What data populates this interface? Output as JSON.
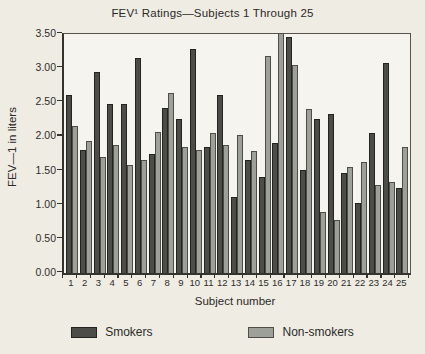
{
  "title": "FEV¹ Ratings—Subjects 1 Through 25",
  "axes": {
    "x_title": "Subject number",
    "y_title": "FEV—1 in liters"
  },
  "legend": {
    "smokers_label": "Smokers",
    "nonsmokers_label": "Non-smokers"
  },
  "colors": {
    "smokers_bar": "#4c4d49",
    "nonsmokers_bar": "#9da098",
    "paper_background": "#efece4",
    "plot_background": "#f6f4ee",
    "axis_line": "#35332e"
  },
  "chart_data": {
    "type": "bar",
    "title": "FEV¹ Ratings—Subjects 1 Through 25",
    "xlabel": "Subject number",
    "ylabel": "FEV—1 in liters",
    "ylim": [
      0,
      3.5
    ],
    "ytick_labels": [
      "0.00",
      "0.50",
      "1.00",
      "1.50",
      "2.00",
      "2.50",
      "3.00",
      "3.50"
    ],
    "grid": false,
    "legend_position": "bottom",
    "categories": [
      "1",
      "2",
      "3",
      "4",
      "5",
      "6",
      "7",
      "8",
      "9",
      "10",
      "11",
      "12",
      "13",
      "14",
      "15",
      "16",
      "17",
      "18",
      "19",
      "20",
      "21",
      "22",
      "23",
      "24",
      "25"
    ],
    "series": [
      {
        "name": "Smokers",
        "color": "#4c4d49",
        "values": [
          2.6,
          1.8,
          2.95,
          2.47,
          2.47,
          3.15,
          1.75,
          2.42,
          2.26,
          3.28,
          1.85,
          2.6,
          1.12,
          1.66,
          1.4,
          1.91,
          3.45,
          1.51,
          2.26,
          2.33,
          1.46,
          1.03,
          2.05,
          3.08,
          1.25
        ]
      },
      {
        "name": "Non-smokers",
        "color": "#9da098",
        "values": [
          2.15,
          1.93,
          1.7,
          1.88,
          1.58,
          1.65,
          2.06,
          2.63,
          1.84,
          1.8,
          2.05,
          1.88,
          2.02,
          1.78,
          3.18,
          3.52,
          3.05,
          2.4,
          0.9,
          0.78,
          1.55,
          1.63,
          1.29,
          1.33,
          1.85
        ]
      }
    ]
  }
}
